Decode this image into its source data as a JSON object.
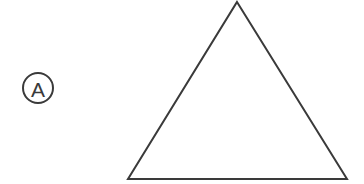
{
  "figure": {
    "background_color": "#ffffff",
    "stroke_color": "#3a3a3a",
    "width": 364,
    "height": 184,
    "label": {
      "text": "A",
      "style": "circled-letter",
      "circle_center_x": 38,
      "circle_center_y": 88,
      "circle_radius": 15,
      "stroke_width": 2
    },
    "shape": {
      "name": "triangle",
      "fill": "none",
      "stroke_width": 2,
      "points": "237,2 347,179 128,179",
      "vertices": [
        {
          "name": "apex",
          "x": 237,
          "y": 2
        },
        {
          "name": "bottom-right",
          "x": 347,
          "y": 179
        },
        {
          "name": "bottom-left",
          "x": 128,
          "y": 179
        }
      ]
    }
  }
}
